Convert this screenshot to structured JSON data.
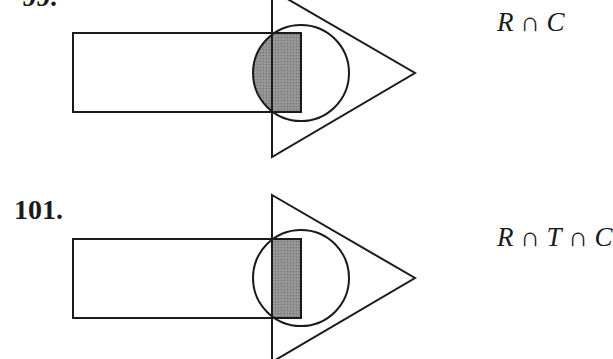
{
  "problems": [
    {
      "number": "99.",
      "expression": {
        "terms": [
          "R",
          "C"
        ],
        "operator": "∩",
        "text": "R ∩ C"
      },
      "diagram": {
        "rectangle": {
          "x": 73,
          "y": 33,
          "width": 228,
          "height": 79
        },
        "triangle": {
          "points": [
            [
              272,
              -10
            ],
            [
              415,
              73
            ],
            [
              272,
              157
            ]
          ]
        },
        "circle": {
          "cx": 301,
          "cy": 73,
          "r": 48
        },
        "shaded_region": "R ∩ C",
        "shade_color": "#8c8c8c",
        "stroke_color": "#1a1a1a"
      }
    },
    {
      "number": "101.",
      "expression": {
        "terms": [
          "R",
          "T",
          "C"
        ],
        "operator": "∩",
        "text": "R ∩ T ∩ C"
      },
      "diagram": {
        "rectangle": {
          "x": 73,
          "y": 239,
          "width": 228,
          "height": 79
        },
        "triangle": {
          "points": [
            [
              272,
              195
            ],
            [
              415,
              278
            ],
            [
              272,
              362
            ]
          ]
        },
        "circle": {
          "cx": 301,
          "cy": 278,
          "r": 48
        },
        "shaded_region": "R ∩ T ∩ C",
        "shade_color": "#8c8c8c",
        "stroke_color": "#1a1a1a"
      }
    }
  ],
  "labels": {
    "p99_number": "99.",
    "p99_expr_R": "R",
    "p99_expr_op1": " ∩ ",
    "p99_expr_C": "C",
    "p101_number": "101.",
    "p101_expr_R": "R",
    "p101_expr_op1": " ∩ ",
    "p101_expr_T": "T",
    "p101_expr_op2": " ∩ ",
    "p101_expr_C": "C"
  }
}
